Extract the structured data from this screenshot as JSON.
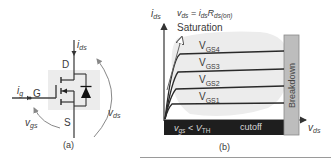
{
  "panel_a": {
    "caption": "(a)",
    "labels": {
      "drain": "D",
      "gate": "G",
      "source": "S",
      "ids_main": "i",
      "ids_sub": "ds",
      "ig_main": "i",
      "ig_sub": "g",
      "vgs_main": "v",
      "vgs_sub": "gs",
      "vds_main": "v",
      "vds_sub": "ds"
    }
  },
  "panel_b": {
    "caption": "(b)",
    "y_axis_main": "i",
    "y_axis_sub": "ds",
    "x_axis_main": "v",
    "x_axis_sub": "ds",
    "equation": {
      "v": "v",
      "v_sub": "ds",
      "eq": " = ",
      "i": "i",
      "i_sub": "ds",
      "r": "R",
      "r_sub": "ds(on)"
    },
    "saturation_label": "Saturation",
    "curves": [
      {
        "main": "V",
        "sub": "GS4"
      },
      {
        "main": "V",
        "sub": "GS3"
      },
      {
        "main": "V",
        "sub": "GS2"
      },
      {
        "main": "V",
        "sub": "GS1"
      }
    ],
    "breakdown_label": "Breakdown",
    "cutoff": {
      "v": "v",
      "v_sub": "gs",
      "lt": " < ",
      "vth": "V",
      "vth_sub": "TH",
      "label": "cutoff"
    },
    "colors": {
      "cutoff_bar": "#1e1e1e",
      "breakdown_bar": "#bdbdbd",
      "blob": "#ececec",
      "curve": "#2a2a2a"
    }
  }
}
